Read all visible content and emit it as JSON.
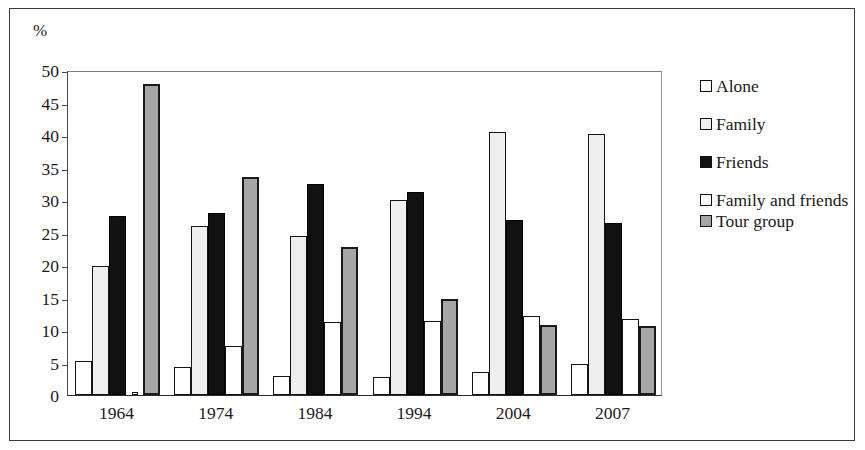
{
  "figure": {
    "unit_label": "%"
  },
  "chart_data": {
    "type": "bar",
    "title": "",
    "subtitle": "",
    "xlabel": "",
    "ylabel": "%",
    "ylim": [
      0,
      50
    ],
    "ytick_step": 5,
    "yticks": [
      0,
      5,
      10,
      15,
      20,
      25,
      30,
      35,
      40,
      45,
      50
    ],
    "ytick_labels": [
      "0",
      "5",
      "10",
      "15",
      "20",
      "25",
      "30",
      "35",
      "40",
      "45",
      "50"
    ],
    "categories": [
      "1964",
      "1974",
      "1984",
      "1994",
      "2004",
      "2007"
    ],
    "grid": false,
    "legend_position": "right",
    "series": [
      {
        "name": "Alone",
        "color": "#ffffff",
        "values": [
          5.2,
          4.3,
          3.0,
          2.7,
          3.6,
          4.7
        ]
      },
      {
        "name": "Family",
        "color": "#eeeeee",
        "values": [
          19.8,
          26.0,
          24.5,
          30.0,
          40.5,
          40.1
        ]
      },
      {
        "name": "Friends",
        "color": "#111111",
        "values": [
          27.6,
          28.0,
          32.4,
          31.2,
          27.0,
          26.4
        ]
      },
      {
        "name": "Family and friends",
        "color": "#ffffff",
        "values": [
          0.5,
          7.5,
          11.3,
          11.4,
          12.2,
          11.7
        ]
      },
      {
        "name": "Tour group",
        "color": "#a6a6a6",
        "values": [
          47.8,
          33.6,
          22.8,
          14.8,
          10.8,
          10.6
        ]
      }
    ]
  }
}
